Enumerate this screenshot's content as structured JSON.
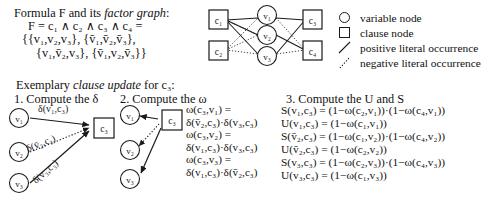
{
  "formula": {
    "title_prefix": "Formula F and its ",
    "title_italic": "factor graph",
    "title_suffix": ":",
    "line1": "F = c₁ ∧ c₂ ∧ c₃ ∧ c₄ =",
    "line2": "{{v₁,v₂,v₃}, {v̄₁,v̄₂,v̄₃},",
    "line3": "{v₁,v̄₂,v₃}, {v̄₁,v₂,v̄₃}}"
  },
  "factor_graph": {
    "clause_nodes": [
      "c₁",
      "c₂",
      "c₃",
      "c₄"
    ],
    "variable_nodes": [
      "v₁",
      "v₂",
      "v₃"
    ],
    "positive_edges": [
      [
        "c1",
        "v1"
      ],
      [
        "c1",
        "v2"
      ],
      [
        "c1",
        "v3"
      ],
      [
        "c3",
        "v1"
      ],
      [
        "c3",
        "v3"
      ],
      [
        "c4",
        "v2"
      ]
    ],
    "negative_edges": [
      [
        "c2",
        "v1"
      ],
      [
        "c2",
        "v2"
      ],
      [
        "c2",
        "v3"
      ],
      [
        "c3",
        "v2"
      ],
      [
        "c4",
        "v1"
      ],
      [
        "c4",
        "v3"
      ]
    ]
  },
  "legend": {
    "items": [
      {
        "glyph": "circle",
        "label": "variable node"
      },
      {
        "glyph": "square",
        "label": "clause node"
      },
      {
        "glyph": "solid-line",
        "label": "positive literal occurrence"
      },
      {
        "glyph": "dotted-line",
        "label": "negative literal occurrence"
      }
    ]
  },
  "exemplary": {
    "prefix": "Exemplary ",
    "italic": "clause update",
    "suffix": " for c₃:",
    "step1_heading": "1. Compute the δ",
    "step2_heading": "2. Compute the ω",
    "step3_heading": "3. Compute the U and S"
  },
  "step1": {
    "var_nodes": [
      "v₁",
      "v₂",
      "v₃"
    ],
    "clause_node": "c₃",
    "edge_labels": [
      "δ(v₁,c₃)",
      "δ(v̄₂,c₃)",
      "δ(v₃,c₃)"
    ]
  },
  "step2": {
    "var_nodes": [
      "v₁",
      "v₂",
      "v₃"
    ],
    "clause_node": "c₃",
    "equations": [
      "ω(c₃,v₁) =",
      "δ(v̄₂,c₃)·δ(v₃,c₃)",
      "ω(c₃,v₂) =",
      "δ(v₁,c₃)·δ(v₃,c₃)",
      "ω(c₃,v₃) =",
      "δ(v₁,c₃)·δ(v̄₂,c₃)"
    ]
  },
  "step3": {
    "equations": [
      "S(v₁,c₃) = (1−ω(c₂,v₁))·(1−ω(c₄,v₁))",
      "U(v₁,c₃) = (1−ω(c₁,v₁))",
      "S(v̄₂,c₃) = (1−ω(c₁,v₂))·(1−ω(c₄,v₂))",
      "U(v̄₂,c₃) = (1−ω(c₂,v₂))",
      "S(v₃,c₃) = (1−ω(c₂,v₃))·(1−ω(c₄,v₃))",
      "U(v₃,c₃) = (1−ω(c₁,v₃))"
    ]
  },
  "colors": {
    "ink": "#1a1a1a",
    "background": "#ffffff"
  }
}
